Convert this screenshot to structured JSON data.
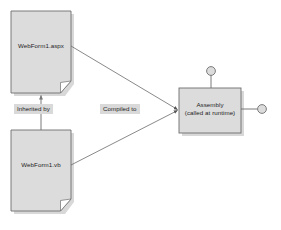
{
  "diagram": {
    "background_color": "#ffffff",
    "shape_fill": "#dcdcdc",
    "shape_stroke": "#6e6e6e",
    "shadow_color": "#b4b4b4",
    "label_background": "#d9d9d9",
    "text_color": "#1c1c1c",
    "nodes": [
      {
        "id": "webform-aspx",
        "shape": "document",
        "label": "WebForm1.aspx",
        "x": 11,
        "y": 11,
        "width": 60,
        "height": 82
      },
      {
        "id": "webform-vb",
        "shape": "document",
        "label": "WebForm1.vb",
        "x": 11,
        "y": 130,
        "width": 60,
        "height": 81
      },
      {
        "id": "assembly",
        "shape": "rectangle",
        "label_line1": "Assembly",
        "label_line2": "(called at runtime)",
        "x": 179,
        "y": 88,
        "width": 62,
        "height": 45
      }
    ],
    "edges": [
      {
        "id": "inherited-by",
        "label": "Inherited by",
        "from": "webform-vb",
        "to": "webform-aspx",
        "arrow": "open"
      },
      {
        "id": "compiled-to-aspx",
        "label": "Compiled to",
        "from": "webform-aspx",
        "to": "assembly",
        "arrow": "filled"
      },
      {
        "id": "compiled-to-vb",
        "label": "",
        "from": "webform-vb",
        "to": "assembly",
        "arrow": "filled"
      }
    ],
    "interfaces": [
      {
        "id": "interface-top",
        "cx": 211,
        "cy": 71,
        "r": 4.5,
        "attach_side": "top"
      },
      {
        "id": "interface-right",
        "cx": 262,
        "cy": 109,
        "r": 4.5,
        "attach_side": "right"
      }
    ]
  }
}
